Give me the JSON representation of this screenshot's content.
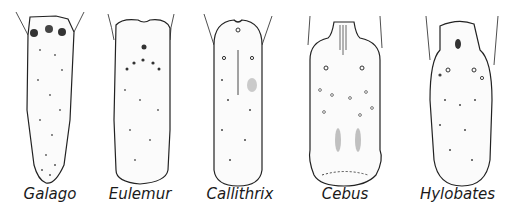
{
  "figure": {
    "specimens": [
      {
        "name": "Galago"
      },
      {
        "name": "Eulemur"
      },
      {
        "name": "Callithrix"
      },
      {
        "name": "Cebus"
      },
      {
        "name": "Hylobates"
      }
    ]
  },
  "colors": {
    "ink": "#1a1a1a",
    "paper": "#ffffff"
  }
}
